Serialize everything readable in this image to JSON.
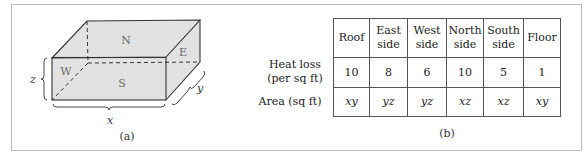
{
  "figure_a": {
    "caption": "(a)",
    "faces": {
      "north": "N",
      "south": "S",
      "east": "E",
      "west": "W"
    },
    "dimensions": {
      "x": "x",
      "y": "y",
      "z": "z"
    }
  },
  "figure_b": {
    "caption": "(b)",
    "row_labels": {
      "heat_loss_line1": "Heat loss",
      "heat_loss_line2": "(per sq ft)",
      "area": "Area (sq ft)"
    },
    "columns": [
      {
        "line1": "Roof",
        "line2": "",
        "heat_loss": "10",
        "area": "xy"
      },
      {
        "line1": "East",
        "line2": "side",
        "heat_loss": "8",
        "area": "yz"
      },
      {
        "line1": "West",
        "line2": "side",
        "heat_loss": "6",
        "area": "yz"
      },
      {
        "line1": "North",
        "line2": "side",
        "heat_loss": "10",
        "area": "xz"
      },
      {
        "line1": "South",
        "line2": "side",
        "heat_loss": "5",
        "area": "xz"
      },
      {
        "line1": "Floor",
        "line2": "",
        "heat_loss": "1",
        "area": "xy"
      }
    ]
  },
  "colors": {
    "face_fill": "#e2e2e2",
    "edge": "#333333",
    "frame": "#bcbcbc"
  }
}
